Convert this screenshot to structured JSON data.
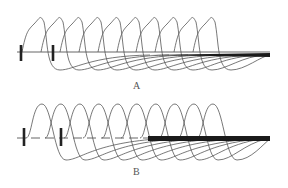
{
  "figure": {
    "panels": [
      {
        "id": "A",
        "label": "A",
        "baseline_y": 52,
        "baseline_x_start": 17,
        "baseline_x_end": 270,
        "baseline_style": "solid",
        "ticks": [
          21,
          53
        ],
        "tick_top": 45,
        "tick_bottom": 61,
        "thick_bar": {
          "x_start": 150,
          "x_end": 270,
          "y": 55,
          "thickness": 4,
          "taper": true
        },
        "loop_count": 10,
        "loop_first_x": 30,
        "loop_step": 19,
        "peak_y": 16,
        "trough_y": 70
      },
      {
        "id": "B",
        "label": "B",
        "baseline_y": 138,
        "baseline_x_start": 17,
        "baseline_x_end": 150,
        "baseline_style": "dashed",
        "ticks": [
          24,
          61
        ],
        "tick_top": 128,
        "tick_bottom": 146,
        "thick_bar": {
          "x_start": 148,
          "x_end": 270,
          "y": 138.5,
          "thickness": 5,
          "taper": false
        },
        "loop_count": 10,
        "loop_first_x": 36,
        "loop_step": 19,
        "peak_y": 104,
        "trough_y": 160
      }
    ],
    "colors": {
      "line": "#555555",
      "bar": "#1a1a1a",
      "tick": "#222222",
      "background": "#ffffff"
    }
  }
}
